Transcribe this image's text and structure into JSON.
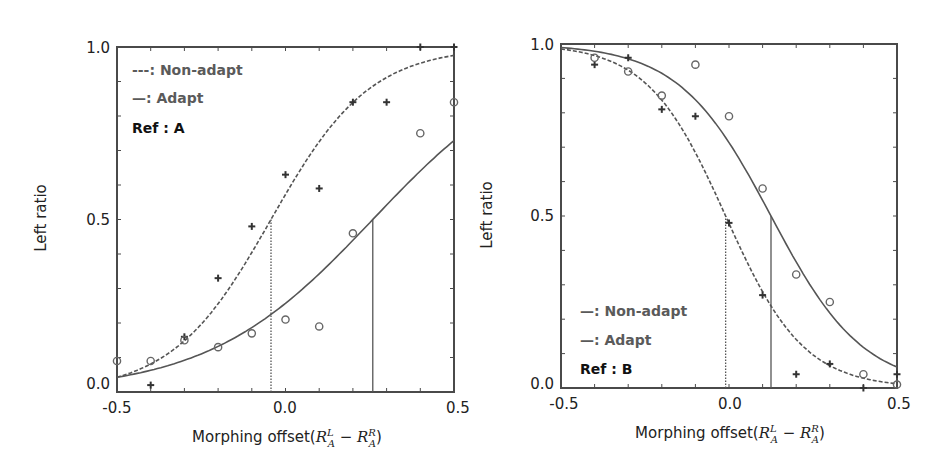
{
  "chart_data": [
    {
      "type": "scatter",
      "panel": "left",
      "title": "",
      "xlabel": "Morphing offset(R_A^L − R_A^R)",
      "ylabel": "Left ratio",
      "xlim": [
        -0.5,
        0.5
      ],
      "ylim": [
        0.0,
        1.0
      ],
      "x_ticks": [
        "-0.5",
        "0.0",
        "0.5"
      ],
      "y_ticks": [
        "0.0",
        "0.5",
        "1.0"
      ],
      "grid": false,
      "legend": {
        "position": "upper-left",
        "entries": [
          "---: Non-adapt",
          "—: Adapt"
        ],
        "ref_label": "Ref : A"
      },
      "series": [
        {
          "name": "Non-adapt",
          "marker": "plus",
          "line": "dashed",
          "x": [
            -0.4,
            -0.3,
            -0.2,
            -0.1,
            0.0,
            0.1,
            0.2,
            0.3,
            0.4,
            0.5
          ],
          "values": [
            0.02,
            0.16,
            0.33,
            0.48,
            0.63,
            0.59,
            0.84,
            0.84,
            1.0,
            1.0
          ],
          "fit": {
            "model": "logistic",
            "midpoint": -0.043,
            "slope": 6.8
          }
        },
        {
          "name": "Adapt",
          "marker": "circle",
          "line": "solid",
          "x": [
            -0.5,
            -0.4,
            -0.3,
            -0.2,
            -0.1,
            0.0,
            0.1,
            0.2,
            0.4,
            0.5
          ],
          "values": [
            0.09,
            0.09,
            0.15,
            0.13,
            0.17,
            0.21,
            0.19,
            0.46,
            0.75,
            0.84
          ],
          "fit": {
            "model": "logistic",
            "midpoint": 0.259,
            "slope": 4.1
          }
        }
      ],
      "annotations": [
        {
          "type": "vline",
          "x": -0.043,
          "y_top": 0.5,
          "style": "dotted",
          "series": "Non-adapt"
        },
        {
          "type": "vline",
          "x": 0.259,
          "y_top": 0.5,
          "style": "solid",
          "series": "Adapt"
        }
      ]
    },
    {
      "type": "scatter",
      "panel": "right",
      "title": "",
      "xlabel": "Morphing offset(R_A^L − R_A^R)",
      "ylabel": "Left ratio",
      "xlim": [
        -0.5,
        0.5
      ],
      "ylim": [
        0.0,
        1.0
      ],
      "x_ticks": [
        "-0.5",
        "0.0",
        "0.5"
      ],
      "y_ticks": [
        "0.0",
        "0.5",
        "1.0"
      ],
      "grid": false,
      "legend": {
        "position": "lower-left",
        "entries": [
          "—: Non-adapt",
          "—: Adapt"
        ],
        "ref_label": "Ref : B"
      },
      "series": [
        {
          "name": "Non-adapt",
          "marker": "plus",
          "line": "dashed",
          "x": [
            -0.4,
            -0.3,
            -0.2,
            -0.1,
            0.0,
            0.1,
            0.2,
            0.3,
            0.4,
            0.5
          ],
          "values": [
            0.94,
            0.96,
            0.81,
            0.79,
            0.48,
            0.27,
            0.04,
            0.07,
            0.0,
            0.04
          ],
          "fit": {
            "model": "logistic-decreasing",
            "midpoint": -0.01,
            "slope": 8.6
          }
        },
        {
          "name": "Adapt",
          "marker": "circle",
          "line": "solid",
          "x": [
            -0.4,
            -0.3,
            -0.2,
            -0.1,
            0.0,
            0.1,
            0.2,
            0.3,
            0.4,
            0.5
          ],
          "values": [
            0.96,
            0.92,
            0.85,
            0.94,
            0.79,
            0.58,
            0.33,
            0.25,
            0.04,
            0.01
          ],
          "fit": {
            "model": "logistic-decreasing",
            "midpoint": 0.125,
            "slope": 7.3
          }
        }
      ],
      "annotations": [
        {
          "type": "vline",
          "x": -0.01,
          "y_top": 0.5,
          "style": "dotted",
          "series": "Non-adapt"
        },
        {
          "type": "vline",
          "x": 0.125,
          "y_top": 0.5,
          "style": "solid",
          "series": "Adapt"
        }
      ]
    }
  ],
  "panels": {
    "left": {
      "y_label": "Left ratio",
      "y_tick_top": "1.0",
      "y_tick_mid": "0.5",
      "y_tick_bottom": "0.0",
      "x_tick_left": "-0.5",
      "x_tick_mid": "0.0",
      "x_tick_right": "0.5",
      "x_label_prefix": "Morphing offset(",
      "x_label_suffix": ")",
      "legend_line1": "---: Non-adapt",
      "legend_line2": "—: Adapt",
      "legend_ref": "Ref : A"
    },
    "right": {
      "y_label": "Left ratio",
      "y_tick_top": "1.0",
      "y_tick_mid": "0.5",
      "y_tick_bottom": "0.0",
      "x_tick_left": "-0.5",
      "x_tick_mid": "0.0",
      "x_tick_right": "0.5",
      "x_label_prefix": "Morphing offset(",
      "x_label_suffix": ")",
      "legend_line1": "—: Non-adapt",
      "legend_line2": "—: Adapt",
      "legend_ref": "Ref : B"
    }
  },
  "math": {
    "R": "R",
    "sup_L": "L",
    "sup_R": "R",
    "sub_A": "A",
    "minus": " − "
  },
  "colors": {
    "frame": "#4a4a4a",
    "line": "#555555",
    "marker_plus": "#333333",
    "marker_circle": "#666666",
    "legend_text": "#5a5a5a"
  }
}
